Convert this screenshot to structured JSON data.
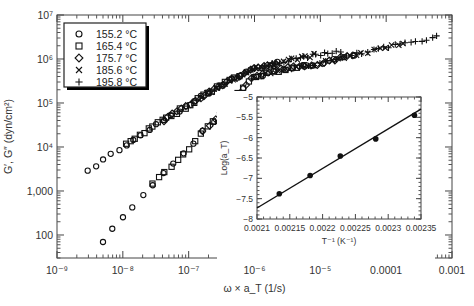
{
  "chart_data": [
    {
      "type": "scatter",
      "title": "",
      "xlabel": "ω × a_T (1/s)",
      "ylabel": "G′, G″ (dyn/cm²)",
      "xscale": "log",
      "yscale": "log",
      "xlim": [
        1e-09,
        0.001
      ],
      "ylim": [
        30,
        10000000
      ],
      "x_tick_labels": [
        "10⁻⁹",
        "10⁻⁸",
        "10⁻⁷",
        "10⁻⁶",
        "10⁻⁵",
        "0.0001",
        "0.001"
      ],
      "y_tick_labels": [
        "100",
        "1,000",
        "10⁴",
        "10⁵",
        "10⁶",
        "10⁷"
      ],
      "grid": false,
      "legend_position": "upper-left",
      "legend": [
        {
          "marker": "circle",
          "label": "155.2 °C"
        },
        {
          "marker": "square",
          "label": "165.4 °C"
        },
        {
          "marker": "diamond",
          "label": "175.7 °C"
        },
        {
          "marker": "x",
          "label": "185.6 °C"
        },
        {
          "marker": "plus",
          "label": "195.8 °C"
        }
      ],
      "series": [
        {
          "name": "G′ (storage modulus, master curve)",
          "x": [
            5e-09,
            1e-08,
            3e-08,
            1e-07,
            3e-07,
            1e-06,
            3e-06,
            1e-05,
            3e-05,
            0.0001,
            0.0003,
            0.0006
          ],
          "y": [
            70,
            250,
            1500,
            9000,
            60000,
            400000,
            600000,
            800000,
            1200000,
            1800000,
            2600000,
            3200000
          ]
        },
        {
          "name": "G″ (loss modulus, master curve)",
          "x": [
            3e-09,
            1e-08,
            3e-08,
            1e-07,
            3e-07,
            1e-06,
            3e-06,
            1e-05,
            2e-05
          ],
          "y": [
            3000,
            10000,
            30000,
            90000,
            250000,
            600000,
            900000,
            1300000,
            1500000
          ]
        }
      ]
    },
    {
      "type": "line",
      "title": "",
      "xlabel": "T⁻¹ (K⁻¹)",
      "ylabel": "Log(a_T)",
      "xlim": [
        0.0021,
        0.00235
      ],
      "ylim": [
        -8,
        -5
      ],
      "x_tick_labels": [
        "0.0021",
        "0.00215",
        "0.0022",
        "0.00225",
        "0.0023",
        "0.00235"
      ],
      "y_tick_labels": [
        "-5",
        "-5.5",
        "-6",
        "-6.5",
        "-7",
        "-7.5",
        "-8"
      ],
      "grid": false,
      "x": [
        0.002134,
        0.002181,
        0.002227,
        0.002281,
        0.00234
      ],
      "values": [
        -7.38,
        -6.93,
        -6.45,
        -6.03,
        -5.45
      ],
      "fit_line": {
        "x": [
          0.0021,
          0.00235
        ],
        "y": [
          -7.73,
          -5.3
        ]
      }
    }
  ]
}
